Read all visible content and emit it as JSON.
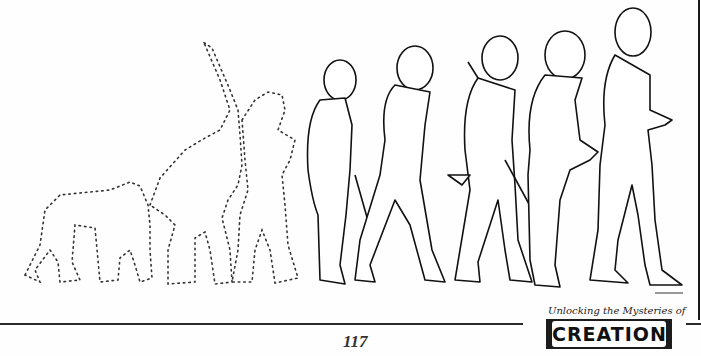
{
  "page": {
    "page_number": "117",
    "logo": {
      "tagline": "Unlocking the Mysteries of",
      "wordmark": "CREATION"
    },
    "illustration": {
      "description": "Line drawing of evolutionary march: three dotted-outline ape/hominid silhouettes followed by five drawn human figures walking right",
      "dotted_figures": [
        "quadruped-ape",
        "upright-ape",
        "hominid"
      ],
      "drawn_figures": [
        "figure-1-with-stick",
        "figure-2-walking",
        "figure-3-with-stone-and-spear",
        "figure-4-stooped",
        "figure-5-modern-man"
      ]
    }
  }
}
